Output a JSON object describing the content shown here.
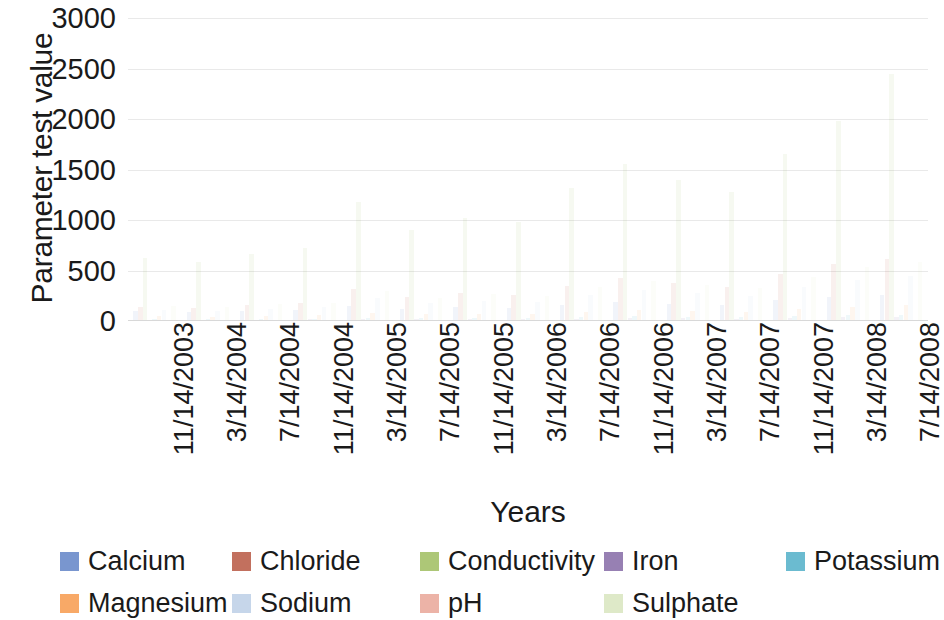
{
  "chart_data": {
    "type": "bar",
    "title": "",
    "xlabel": "Years",
    "ylabel": "Parameter test value",
    "ylim": [
      0,
      3000
    ],
    "y_ticks": [
      0,
      500,
      1000,
      1500,
      2000,
      2500,
      3000
    ],
    "y_tick_labels": [
      "0",
      "500",
      "1000",
      "1500",
      "2000",
      "2500",
      "3000"
    ],
    "grid": true,
    "grid_axis": "y",
    "legend_position": "bottom",
    "legend_columns": 5,
    "categories": [
      "11/14/2003",
      "3/14/2004",
      "7/14/2004",
      "11/14/2004",
      "3/14/2005",
      "7/14/2005",
      "11/14/2005",
      "3/14/2006",
      "7/14/2006",
      "11/14/2006",
      "3/14/2007",
      "7/14/2007",
      "11/14/2007",
      "3/14/2008",
      "7/14/2008"
    ],
    "x_tick_labels": [
      "11/14/2003",
      "3/14/2004",
      "7/14/2004",
      "11/14/2004",
      "3/14/2005",
      "7/14/2005",
      "11/14/2005",
      "3/14/2006",
      "7/14/2006",
      "11/14/2006",
      "3/14/2007",
      "7/14/2007",
      "11/14/2007",
      "3/14/2008",
      "7/14/2008"
    ],
    "series": [
      {
        "name": "Calcium",
        "color": "#5B7FC4",
        "values": [
          95,
          88,
          102,
          110,
          150,
          120,
          135,
          128,
          160,
          185,
          170,
          155,
          210,
          240,
          260
        ]
      },
      {
        "name": "Chloride",
        "color": "#B5513A",
        "values": [
          140,
          130,
          155,
          175,
          320,
          240,
          280,
          260,
          350,
          430,
          380,
          340,
          470,
          560,
          610
        ]
      },
      {
        "name": "Conductivity",
        "color": "#9BBB59",
        "values": [
          620,
          580,
          660,
          720,
          1180,
          900,
          1020,
          980,
          1320,
          1550,
          1400,
          1280,
          1650,
          1980,
          2450
        ]
      },
      {
        "name": "Iron",
        "color": "#8064A2",
        "values": [
          12,
          10,
          14,
          16,
          22,
          18,
          20,
          19,
          24,
          28,
          26,
          23,
          31,
          36,
          40
        ]
      },
      {
        "name": "Potassium",
        "color": "#4BACC6",
        "values": [
          18,
          16,
          20,
          22,
          34,
          27,
          30,
          29,
          38,
          45,
          41,
          37,
          50,
          58,
          64
        ]
      },
      {
        "name": "Magnesium",
        "color": "#F79646",
        "values": [
          45,
          42,
          50,
          55,
          82,
          66,
          74,
          70,
          92,
          108,
          98,
          88,
          118,
          140,
          155
        ]
      },
      {
        "name": "Sodium",
        "color": "#B9CDE5",
        "values": [
          110,
          100,
          120,
          135,
          230,
          175,
          200,
          190,
          260,
          310,
          280,
          250,
          340,
          410,
          450
        ]
      },
      {
        "name": "pH",
        "color": "#E8A294",
        "values": [
          7.4,
          7.3,
          7.5,
          7.4,
          7.2,
          7.3,
          7.4,
          7.5,
          7.3,
          7.2,
          7.4,
          7.5,
          7.3,
          7.2,
          7.4
        ]
      },
      {
        "name": "Sulphate",
        "color": "#D7E4BC",
        "values": [
          150,
          140,
          165,
          180,
          300,
          230,
          265,
          250,
          335,
          400,
          360,
          325,
          440,
          530,
          580
        ]
      }
    ]
  },
  "legend": {
    "items": [
      {
        "label": "Calcium",
        "color": "#5B7FC4"
      },
      {
        "label": "Chloride",
        "color": "#B5513A"
      },
      {
        "label": "Conductivity",
        "color": "#9BBB59"
      },
      {
        "label": "Iron",
        "color": "#8064A2"
      },
      {
        "label": "Potassium",
        "color": "#4BACC6"
      },
      {
        "label": "Magnesium",
        "color": "#F79646"
      },
      {
        "label": "Sodium",
        "color": "#B9CDE5"
      },
      {
        "label": "pH",
        "color": "#E8A294"
      },
      {
        "label": "Sulphate",
        "color": "#D7E4BC"
      }
    ]
  }
}
